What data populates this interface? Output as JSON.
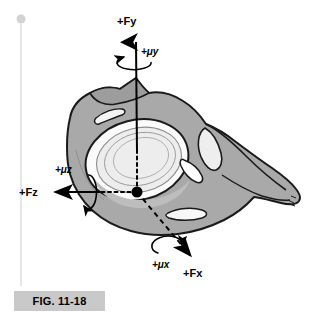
{
  "figure": {
    "caption": "FIG. 11-18",
    "background_color": "#ffffff"
  },
  "colors": {
    "bone_fill": "#a9a9a9",
    "bone_fill_dark": "#9a9a9a",
    "bone_outline": "#1a1a1a",
    "fossa_fill": "#ededed",
    "fossa_rim": "#fcfcfc",
    "contour_line": "#8d8d8d",
    "axis_line": "#000000",
    "caption_background": "#c9c9c9",
    "margin_rule": "#e4e4e4",
    "margin_dot": "#cfcfcf"
  },
  "axes": {
    "origin": {
      "x": 137,
      "y": 192,
      "label": "origin-point"
    },
    "force_vectors": [
      {
        "id": "fy",
        "label": "+Fy",
        "direction": "up",
        "label_x": 117,
        "label_y": 24,
        "tip_x": 135,
        "tip_y": 36,
        "tail_x": 139,
        "tail_y": 192,
        "solid_from_y": 80,
        "dotted": true
      },
      {
        "id": "fz",
        "label": "+Fz",
        "direction": "left",
        "label_x": 20,
        "label_y": 196,
        "tip_x": 54,
        "tip_y": 192,
        "tail_x": 137,
        "tail_y": 192,
        "solid_from_x": 95,
        "dotted": true
      },
      {
        "id": "fx",
        "label": "+Fx",
        "direction": "down-right",
        "label_x": 183,
        "label_y": 275,
        "tip_x": 194,
        "tip_y": 259,
        "tail_x": 137,
        "tail_y": 192,
        "dotted": true
      }
    ],
    "moment_vectors": [
      {
        "id": "muy",
        "label": "+μy",
        "about": "fy",
        "label_x": 140,
        "label_y": 53,
        "ellipse_cx": 134,
        "ellipse_cy": 63,
        "ellipse_rx": 17,
        "ellipse_ry": 7
      },
      {
        "id": "muz",
        "label": "+μz",
        "about": "fz",
        "label_x": 55,
        "label_y": 172,
        "ellipse_cx": 88,
        "ellipse_cy": 191,
        "ellipse_rx": 7,
        "ellipse_ry": 17
      },
      {
        "id": "mux",
        "label": "+μx",
        "about": "fx",
        "label_x": 155,
        "label_y": 267,
        "ellipse_cx": 172,
        "ellipse_cy": 246,
        "ellipse_rx": 14,
        "ellipse_ry": 8,
        "rotation_deg": -40
      }
    ]
  },
  "anatomy": {
    "name": "scapula-lateral-view",
    "parts": [
      {
        "id": "glenoid-fossa",
        "label": "glenoid-fossa"
      },
      {
        "id": "coracoid-process",
        "label": "coracoid-process"
      },
      {
        "id": "acromion",
        "label": "acromion"
      },
      {
        "id": "scapular-spine",
        "label": "scapular-spine"
      },
      {
        "id": "scapular-body",
        "label": "scapular-body"
      }
    ]
  },
  "margin": {
    "rule_top": 18,
    "rule_bottom": 286,
    "rule_x": 21,
    "dot_radius": 4
  }
}
